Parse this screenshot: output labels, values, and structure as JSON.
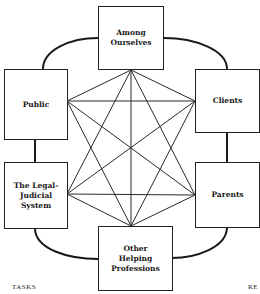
{
  "diagram": {
    "nodes": [
      {
        "id": "among-ourselves",
        "label": "Among\nOurselves"
      },
      {
        "id": "public",
        "label": "Public"
      },
      {
        "id": "clients",
        "label": "Clients"
      },
      {
        "id": "legal-judicial-system",
        "label": "The Legal-\nJudicial\nSystem"
      },
      {
        "id": "parents",
        "label": "Parents"
      },
      {
        "id": "other-helping-professions",
        "label": "Other\nHelping\nProfessions"
      }
    ],
    "edges_inner": [
      [
        "among-ourselves",
        "public"
      ],
      [
        "among-ourselves",
        "clients"
      ],
      [
        "among-ourselves",
        "legal-judicial-system"
      ],
      [
        "among-ourselves",
        "parents"
      ],
      [
        "among-ourselves",
        "other-helping-professions"
      ],
      [
        "public",
        "clients"
      ],
      [
        "public",
        "parents"
      ],
      [
        "public",
        "other-helping-professions"
      ],
      [
        "clients",
        "legal-judicial-system"
      ],
      [
        "clients",
        "other-helping-professions"
      ],
      [
        "legal-judicial-system",
        "parents"
      ],
      [
        "legal-judicial-system",
        "other-helping-professions"
      ],
      [
        "parents",
        "other-helping-professions"
      ]
    ],
    "outer_ring": [
      [
        "among-ourselves",
        "public"
      ],
      [
        "among-ourselves",
        "clients"
      ],
      [
        "public",
        "legal-judicial-system"
      ],
      [
        "clients",
        "parents"
      ],
      [
        "legal-judicial-system",
        "other-helping-professions"
      ],
      [
        "parents",
        "other-helping-professions"
      ]
    ]
  },
  "captions": {
    "left": "TASKS",
    "right": "RE"
  }
}
